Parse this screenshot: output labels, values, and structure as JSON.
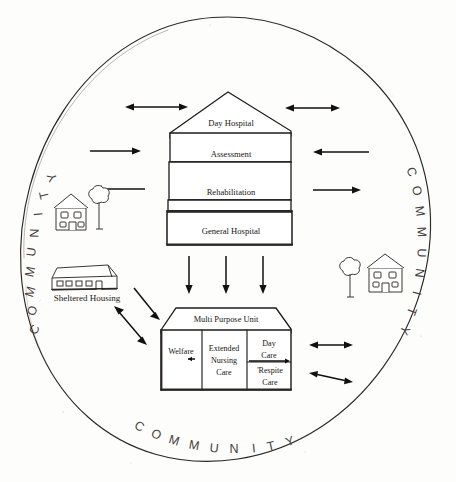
{
  "figure": {
    "ring_label": "COMMUNITY",
    "ring_label_positions": [
      "left",
      "right",
      "bottom"
    ]
  },
  "hospital": {
    "name": "Day Hospital building",
    "floors": [
      {
        "label": "Day Hospital"
      },
      {
        "label": "Assessment"
      },
      {
        "label": "Rehabilitation"
      },
      {
        "label": "General Hospital"
      }
    ]
  },
  "multi_purpose_unit": {
    "title": "Multi Purpose Unit",
    "cells": [
      {
        "label": "Welfare"
      },
      {
        "label": "Extended\nNursing\nCare",
        "lines": [
          "Extended",
          "Nursing",
          "Care"
        ]
      },
      {
        "label": "Day\nCare",
        "lines": [
          "Day",
          "Care"
        ]
      },
      {
        "label": "'Respite\nCare",
        "lines": [
          "'Respite",
          "Care"
        ]
      }
    ]
  },
  "sheltered_housing": {
    "label": "Sheltered Housing"
  },
  "icons": [
    {
      "name": "house-left",
      "label": ""
    },
    {
      "name": "tree-left",
      "label": ""
    },
    {
      "name": "tree-right",
      "label": ""
    },
    {
      "name": "house-right",
      "label": ""
    },
    {
      "name": "sheltered-housing-building",
      "label": ""
    }
  ],
  "arrows": [
    {
      "name": "top-left-double",
      "style": "double"
    },
    {
      "name": "top-right-double",
      "style": "double"
    },
    {
      "name": "mid-left-into-hospital",
      "style": "single-right"
    },
    {
      "name": "mid-right-into-hospital",
      "style": "single-left"
    },
    {
      "name": "lower-left-to-house",
      "style": "single-left"
    },
    {
      "name": "lower-right-out",
      "style": "single-right"
    },
    {
      "name": "hospital-to-unit-1",
      "style": "single-down"
    },
    {
      "name": "hospital-to-unit-2",
      "style": "single-down"
    },
    {
      "name": "hospital-to-unit-3",
      "style": "single-down"
    },
    {
      "name": "housing-to-unit",
      "style": "single-down-right"
    },
    {
      "name": "housing-unit-double",
      "style": "double-diagonal"
    },
    {
      "name": "unit-right-double-upper",
      "style": "double"
    },
    {
      "name": "unit-right-double-lower",
      "style": "double-diagonal"
    },
    {
      "name": "welfare-internal",
      "style": "small-left"
    },
    {
      "name": "daycare-internal",
      "style": "small-right"
    }
  ]
}
